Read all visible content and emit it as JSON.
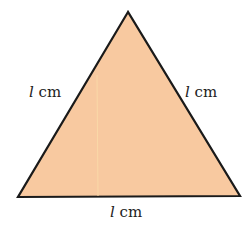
{
  "diagram": {
    "shape": "equilateral triangle",
    "fill_color": "#F8C9A0",
    "stroke_color": "#1a1a1a",
    "labels": {
      "left": {
        "var": "l",
        "unit": "cm"
      },
      "right": {
        "var": "l",
        "unit": "cm"
      },
      "bottom": {
        "var": "l",
        "unit": "cm"
      }
    }
  }
}
